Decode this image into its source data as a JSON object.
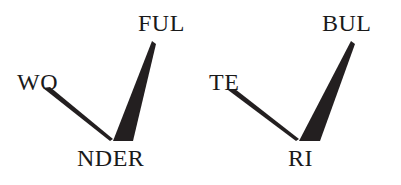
{
  "figure": {
    "width": 401,
    "height": 185,
    "background_color": "#ffffff",
    "ink_color": "#1a1a1a",
    "wedge_color": "#231f20"
  },
  "trees": [
    {
      "id": "wonderful",
      "root_label": "NDER",
      "left_branch_label": "WO",
      "right_branch_label": "FUL",
      "vertex": {
        "x": 113,
        "y": 140
      }
    },
    {
      "id": "terrible",
      "root_label": "RI",
      "left_branch_label": "TE",
      "right_branch_label": "BUL",
      "vertex": {
        "x": 299,
        "y": 140
      }
    }
  ],
  "labels": [
    {
      "name": "label-wo",
      "text": "WO",
      "x": 17,
      "y": 70,
      "font_size": 24
    },
    {
      "name": "label-ful",
      "text": "FUL",
      "x": 138,
      "y": 11,
      "font_size": 24
    },
    {
      "name": "label-nder",
      "text": "NDER",
      "x": 77,
      "y": 146,
      "font_size": 24
    },
    {
      "name": "label-te",
      "text": "TE",
      "x": 209,
      "y": 70,
      "font_size": 24
    },
    {
      "name": "label-bul",
      "text": "BUL",
      "x": 322,
      "y": 11,
      "font_size": 24
    },
    {
      "name": "label-ri",
      "text": "RI",
      "x": 288,
      "y": 146,
      "font_size": 24
    }
  ],
  "wedges": [
    {
      "name": "wedge-wo",
      "tree": "wonderful",
      "side": "left",
      "points": "43,88 50,87 113,139 110,141"
    },
    {
      "name": "wedge-ful",
      "tree": "wonderful",
      "side": "right",
      "points": "152,41 156,44 133,141 113,141"
    },
    {
      "name": "wedge-te",
      "tree": "terrible",
      "side": "left",
      "points": "228,90 235,89 299,139 296,141"
    },
    {
      "name": "wedge-bul",
      "tree": "terrible",
      "side": "right",
      "points": "351,41 355,44 320,141 299,141"
    }
  ]
}
